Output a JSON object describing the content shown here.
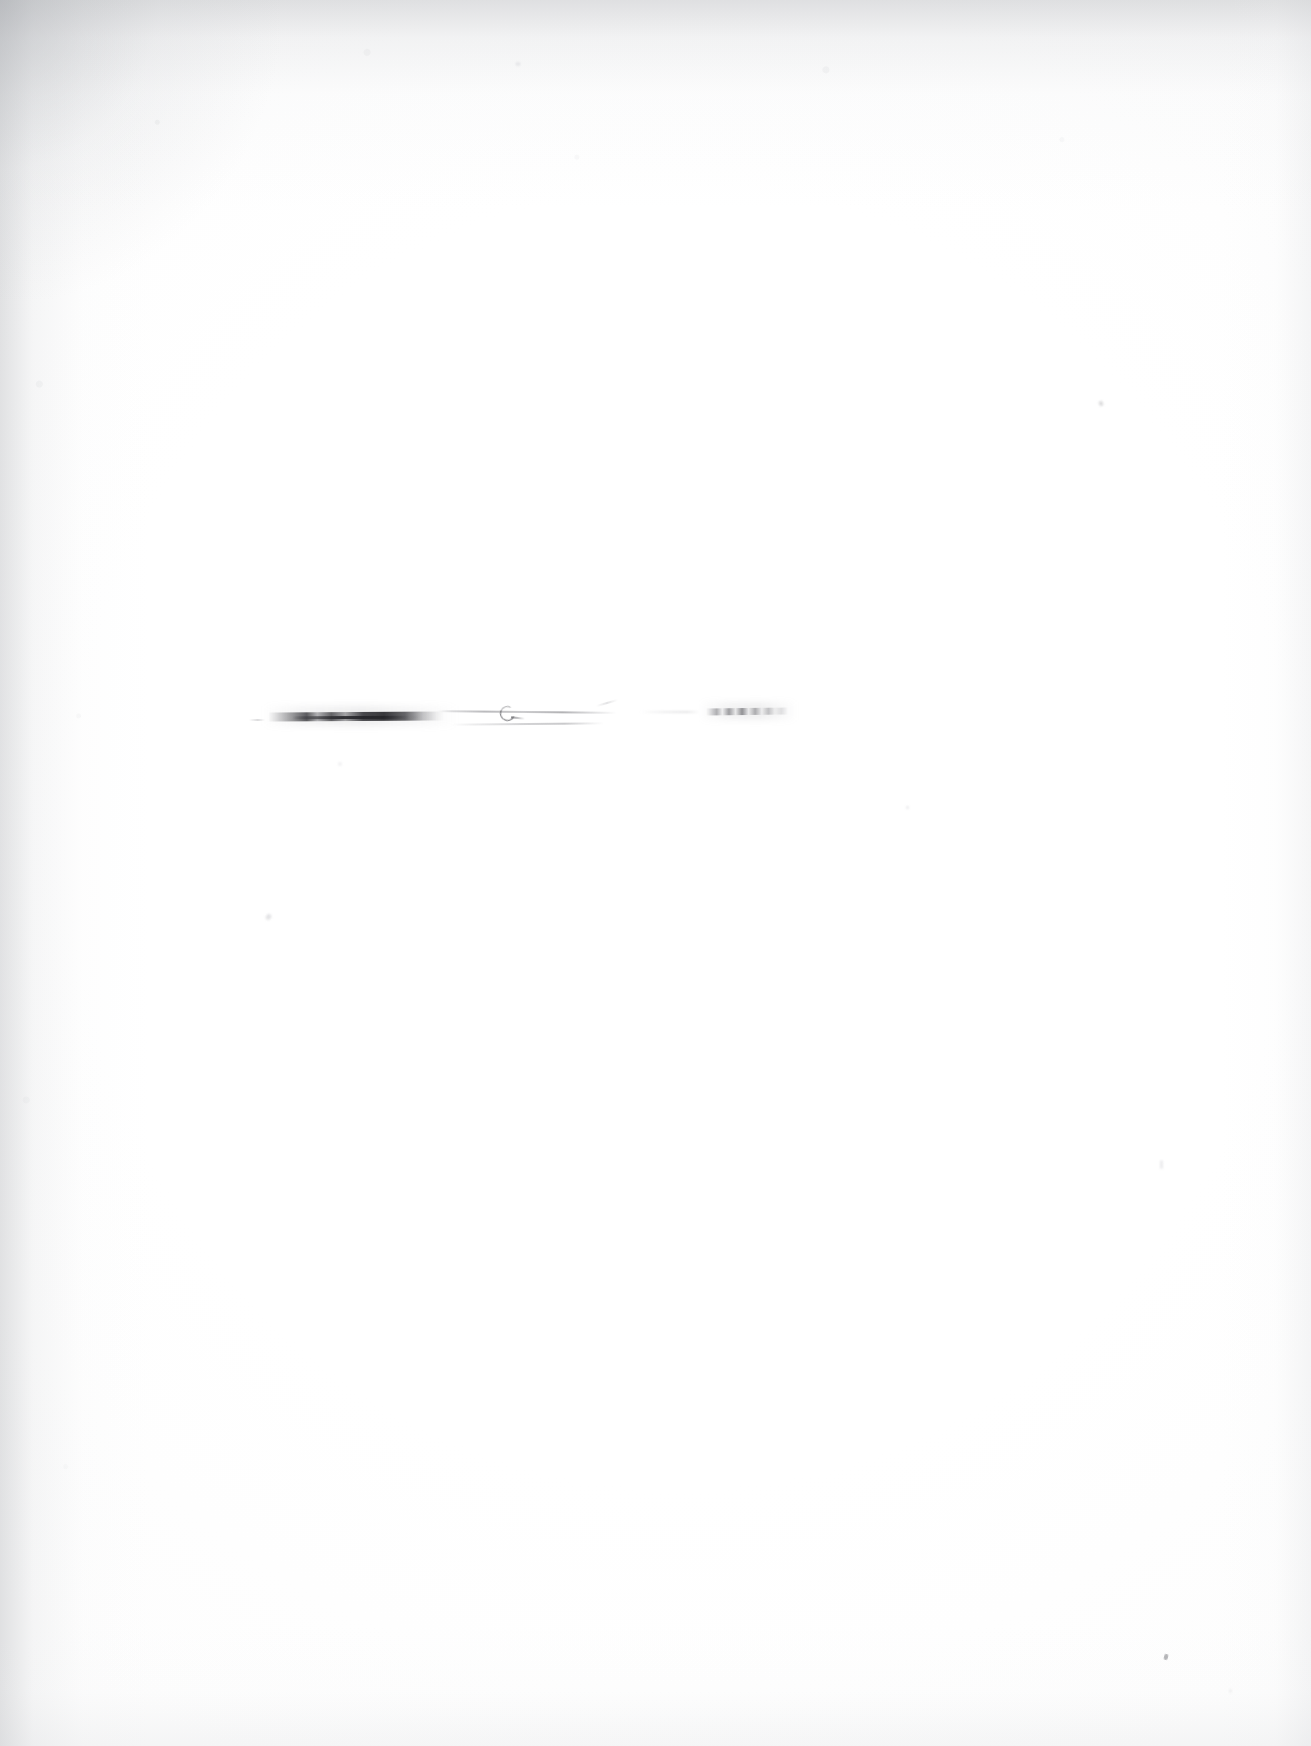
{
  "document": {
    "kind": "scanned-page",
    "content_state": "blank",
    "legible_text": "",
    "note_label": "No legible text content",
    "page_width": 1311,
    "page_height": 1746,
    "orientation": "portrait",
    "background_color": "#ffffff",
    "paper_tone": "#fdfdfd",
    "ink_color": "#3a3a3e",
    "vignette_color": "#b0b2b6"
  },
  "scan_artifacts": {
    "vignette_edges": [
      "top",
      "left",
      "right",
      "bottom"
    ],
    "vignette_strongest_corner": "top-left",
    "grain": "light mottled speckle along top and left margins"
  },
  "ink_marks": {
    "description": "A single horizontal band of heavily faded ink strokes; no letterforms resolve at 3x magnification",
    "band_y": 718,
    "band_x_start": 249,
    "band_x_end": 788,
    "segments": [
      {
        "id": "segment-1",
        "label": "dark tapered smear",
        "x": 268,
        "y": 712,
        "width": 176,
        "darkness": "high"
      },
      {
        "id": "segment-2",
        "label": "hairline stroke with small loop",
        "x": 438,
        "y": 706,
        "width": 180,
        "darkness": "very low",
        "loop_x": 506,
        "loop_y": 712
      },
      {
        "id": "segment-3",
        "label": "broken dashed smear",
        "x": 706,
        "y": 708,
        "width": 82,
        "darkness": "low"
      }
    ]
  },
  "specks": [
    {
      "id": "speck-a",
      "x": 266,
      "y": 914
    },
    {
      "id": "speck-b",
      "x": 1099,
      "y": 401
    },
    {
      "id": "speck-c",
      "x": 1164,
      "y": 1654
    },
    {
      "id": "speck-d",
      "x": 1160,
      "y": 1160
    },
    {
      "id": "speck-e",
      "x": 906,
      "y": 806
    },
    {
      "id": "speck-f",
      "x": 516,
      "y": 62
    },
    {
      "id": "speck-g",
      "x": 338,
      "y": 762
    },
    {
      "id": "speck-h",
      "x": 1229,
      "y": 1689
    }
  ]
}
